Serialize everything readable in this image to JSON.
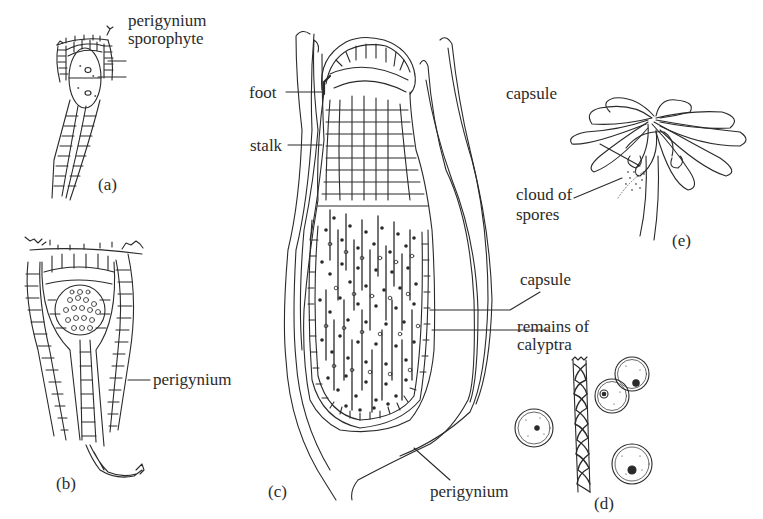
{
  "figure": {
    "top_text_cropped": "",
    "panels": [
      {
        "id": "a",
        "caption": "(a)",
        "labels": [
          "perigynium",
          "sporophyte"
        ]
      },
      {
        "id": "b",
        "caption": "(b)",
        "labels": [
          "perigynium"
        ]
      },
      {
        "id": "c",
        "caption": "(c)",
        "labels": [
          "foot",
          "stalk",
          "capsule",
          "remains of calyptra",
          "perigynium"
        ]
      },
      {
        "id": "d",
        "caption": "(d)",
        "labels": []
      },
      {
        "id": "e",
        "caption": "(e)",
        "labels": [
          "capsule",
          "cloud of spores"
        ]
      }
    ]
  },
  "labels": {
    "a_perigynium": "perigynium",
    "a_sporophyte": "sporophyte",
    "b_perigynium": "perigynium",
    "c_foot": "foot",
    "c_stalk": "stalk",
    "c_capsule": "capsule",
    "c_calyptra_1": "remains of",
    "c_calyptra_2": "calyptra",
    "c_perigynium": "perigynium",
    "e_capsule": "capsule",
    "e_spores_1": "cloud of",
    "e_spores_2": "spores"
  },
  "captions": {
    "a": "(a)",
    "b": "(b)",
    "c": "(c)",
    "d": "(d)",
    "e": "(e)"
  },
  "colors": {
    "ink": "#2a2a2a",
    "background": "#ffffff"
  }
}
